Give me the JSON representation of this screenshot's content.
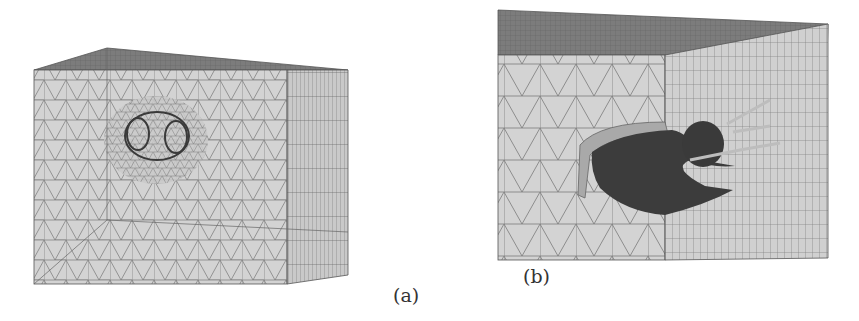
{
  "figure": {
    "panels": [
      {
        "id": "a",
        "label": "(a)",
        "description": "3D finite element mesh of rectangular soil block with twin tunnel openings, refined mesh around tunnels"
      },
      {
        "id": "b",
        "label": "(b)",
        "description": "Close-up cutaway of mesh showing excavated tunnel lining geometry (dark shell) inside block"
      }
    ]
  },
  "colors": {
    "mesh_face": "#d2d2d2",
    "top_face": "#7a7a7a",
    "mesh_line": "#6e6e6e",
    "tunnel_dark": "#3c3c3c",
    "label": "#333333"
  }
}
